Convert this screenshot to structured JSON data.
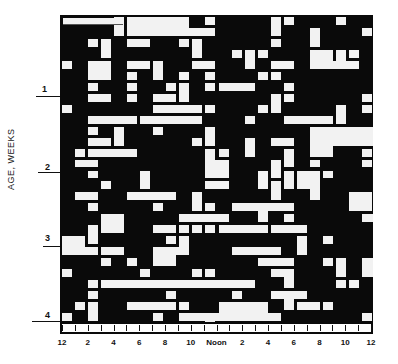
{
  "chart_data": {
    "type": "heatmap",
    "title": "",
    "xlabel": "",
    "ylabel": "AGE, WEEKS",
    "x_tick_labels": [
      "12",
      "2",
      "4",
      "6",
      "8",
      "10",
      "Noon",
      "2",
      "4",
      "6",
      "8",
      "10",
      "12"
    ],
    "y_tick_labels": [
      "1",
      "2",
      "3",
      "4"
    ],
    "x_range_hours": [
      0,
      24
    ],
    "y_range_weeks": [
      0,
      4
    ],
    "encoding": {
      "black": "asleep",
      "white": "awake"
    },
    "colors": {
      "sleep": "#0a0a0a",
      "wake": "#f2f2f2"
    }
  },
  "axis": {
    "y_title": "AGE, WEEKS",
    "y_ticks": [
      {
        "label": "1",
        "top": 94
      },
      {
        "label": "2",
        "top": 172
      },
      {
        "label": "3",
        "top": 243
      },
      {
        "label": "4",
        "top": 316
      }
    ],
    "x_ticks": [
      "12",
      "2",
      "4",
      "6",
      "8",
      "10",
      "Noon",
      "2",
      "4",
      "6",
      "8",
      "10",
      "12"
    ]
  }
}
